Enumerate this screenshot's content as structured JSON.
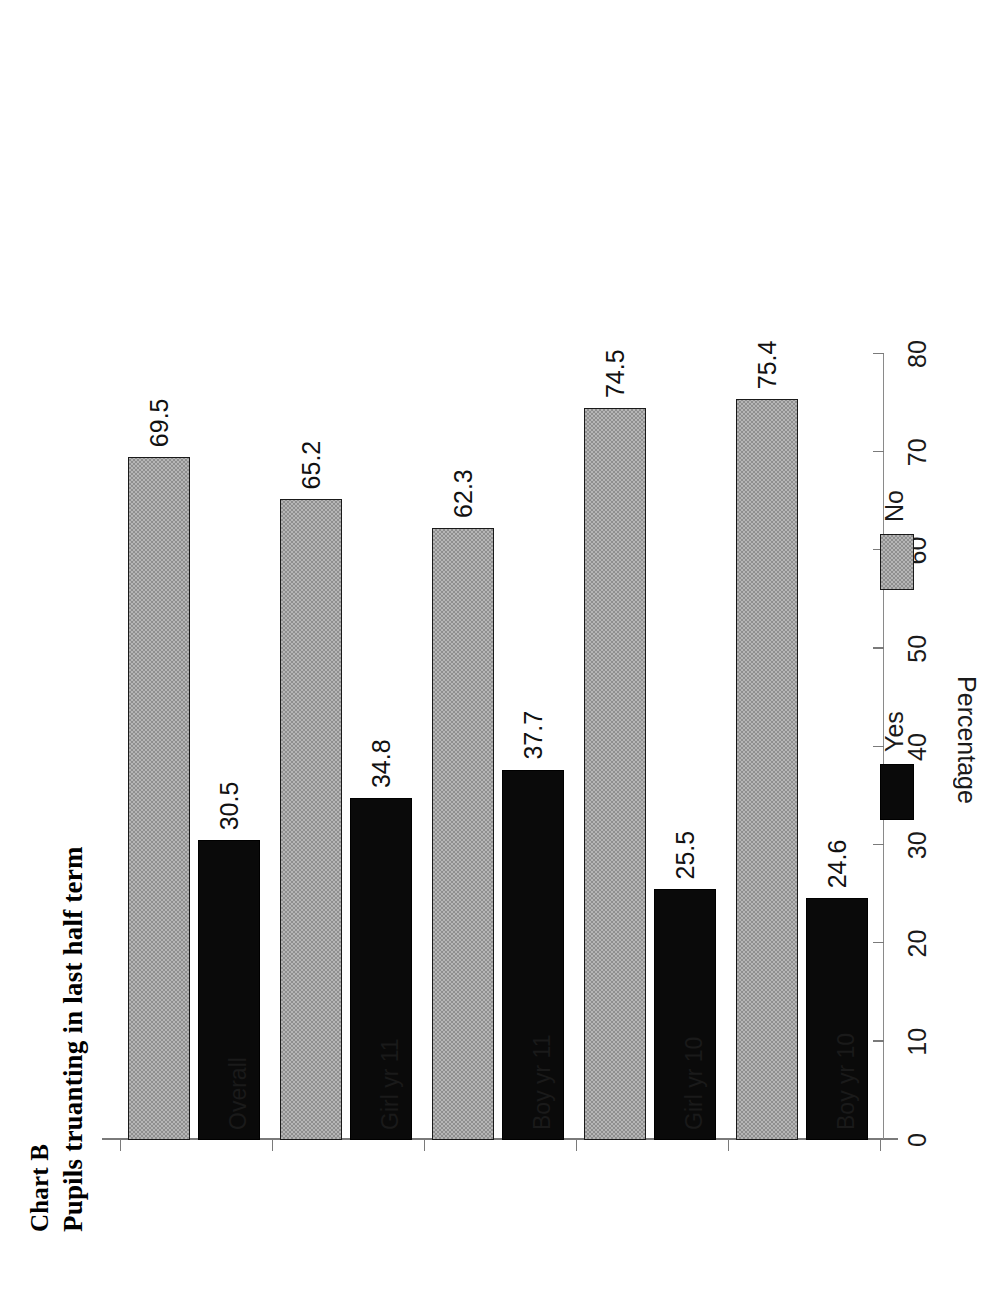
{
  "figure": {
    "chart_label": "Chart B",
    "title": "Pupils truanting in last half term",
    "axis_title": "Percentage"
  },
  "legend": {
    "position": "bottom-center-rotated",
    "entries": [
      {
        "label": "Yes",
        "swatch": "black-swatch",
        "color": "#000000"
      },
      {
        "label": "No",
        "swatch": "gray-swatch",
        "color": "#b6b6b6"
      }
    ]
  },
  "axis": {
    "ticks": [
      "80",
      "70",
      "60",
      "50",
      "40",
      "30",
      "20",
      "10",
      "0"
    ],
    "tick_values": [
      80,
      70,
      60,
      50,
      40,
      30,
      20,
      10,
      0
    ],
    "min": 0,
    "max": 80
  },
  "chart_data": {
    "type": "bar",
    "orientation": "horizontal",
    "title": "Pupils truanting in last half term",
    "subtitle": "Chart B",
    "xlabel": "Percentage",
    "ylabel": "",
    "xlim": [
      0,
      80
    ],
    "grid": false,
    "legend_position": "bottom",
    "categories": [
      "Boy yr 10",
      "Girl yr 10",
      "Boy yr 11",
      "Girl yr 11",
      "Overall"
    ],
    "series": [
      {
        "name": "Yes",
        "color": "#000000",
        "values": [
          24.6,
          25.5,
          37.7,
          34.8,
          30.5
        ]
      },
      {
        "name": "No",
        "color": "#b6b6b6",
        "values": [
          75.4,
          74.5,
          62.3,
          65.2,
          69.5
        ]
      }
    ],
    "data_labels": {
      "Boy yr 10": {
        "Yes": "24.6",
        "No": "75.4"
      },
      "Girl yr 10": {
        "Yes": "25.5",
        "No": "74.5"
      },
      "Boy yr 11": {
        "Yes": "37.7",
        "No": "62.3"
      },
      "Girl yr 11": {
        "Yes": "34.8",
        "No": "65.2"
      },
      "Overall": {
        "Yes": "30.5",
        "No": "69.5"
      }
    }
  }
}
